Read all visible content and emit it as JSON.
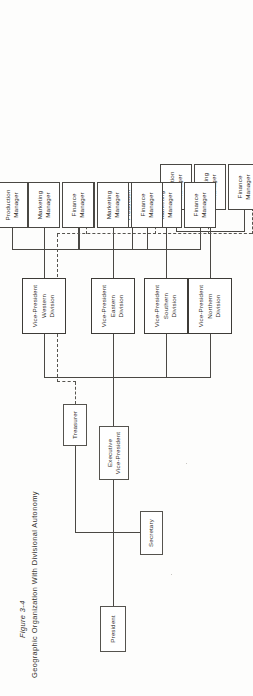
{
  "figure": {
    "number": "Figure 3-4",
    "title": "Geographic Organization With Divisional Autonomy"
  },
  "chart_type": "organizational-chart",
  "legend": {
    "solid_line_meaning": "direct line authority",
    "dashed_line_meaning": "functional / dotted-line reporting to Treasurer"
  },
  "nodes": {
    "president": "President",
    "treasurer": "Treasurer",
    "secretary": "Secretary",
    "executive_vp": "Executive\nVice-President"
  },
  "divisions": [
    {
      "id": "northern",
      "vp": "Vice-President\nNorthern\nDivision",
      "managers": [
        {
          "id": "finance",
          "label": "Finance\nManager"
        },
        {
          "id": "marketing",
          "label": "Marketing\nManager"
        },
        {
          "id": "production",
          "label": "Production\nManager"
        }
      ]
    },
    {
      "id": "southern",
      "vp": "Vice-President\nSouthern\nDivision",
      "managers": [
        {
          "id": "finance",
          "label": "Finance\nManager"
        },
        {
          "id": "marketing",
          "label": "Marketing\nManager"
        },
        {
          "id": "production",
          "label": "Production\nManager"
        }
      ]
    },
    {
      "id": "eastern",
      "vp": "Vice-President\nEastern\nDivision",
      "managers": [
        {
          "id": "finance",
          "label": "Finance\nManager"
        },
        {
          "id": "marketing",
          "label": "Marketing\nManager"
        },
        {
          "id": "production",
          "label": "Production\nManager"
        }
      ]
    },
    {
      "id": "western",
      "vp": "Vice-President\nWestern\nDivision",
      "managers": [
        {
          "id": "finance",
          "label": "Finance\nManager"
        },
        {
          "id": "marketing",
          "label": "Marketing\nManager"
        },
        {
          "id": "production",
          "label": "Production\nManager"
        }
      ]
    }
  ],
  "colors": {
    "ink": "#2e2c29",
    "rule": "#4a4844",
    "dashed": "#56544f",
    "paper": "#ffffff"
  }
}
